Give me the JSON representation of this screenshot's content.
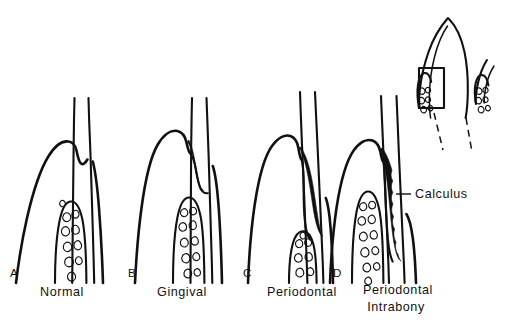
{
  "figure": {
    "kind": "periodontal-pocket-illustration",
    "background_color": "#ffffff",
    "ink_color": "#111111",
    "calculus_color": "#111111",
    "panels": [
      {
        "letter": "A",
        "caption": "Normal",
        "letter_x": 10,
        "letter_y": 277,
        "caption_x": 62,
        "caption_y": 296,
        "has_calculus": false
      },
      {
        "letter": "B",
        "caption": "Gingival",
        "letter_x": 128,
        "letter_y": 277,
        "caption_x": 182,
        "caption_y": 296,
        "has_calculus": true
      },
      {
        "letter": "C",
        "caption": "Periodontal",
        "letter_x": 243,
        "letter_y": 277,
        "caption_x": 302,
        "caption_y": 296,
        "has_calculus": true
      },
      {
        "letter": "D",
        "caption": "Periodontal",
        "caption_line2": "Intrabony",
        "letter_x": 333,
        "letter_y": 277,
        "caption_x": 398,
        "caption_y": 294,
        "caption2_x": 396,
        "caption2_y": 311,
        "has_calculus": true
      }
    ],
    "callout": {
      "label": "Calculus",
      "text_x": 415,
      "text_y": 198,
      "leader_from_x": 396,
      "leader_from_y": 194,
      "leader_to_x": 411,
      "leader_to_y": 194
    },
    "inset": {
      "name": "orientation-tooth-inset",
      "highlight_box": {
        "x": 419,
        "y": 68,
        "width": 25,
        "height": 40
      }
    },
    "footer": {
      "text": "clipped caption text at page edge"
    }
  }
}
